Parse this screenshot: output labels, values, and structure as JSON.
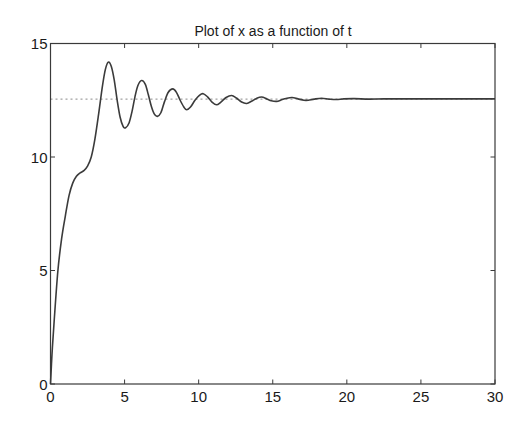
{
  "chart_data": {
    "type": "line",
    "title": "Plot of x as a function of t",
    "xlabel": "",
    "ylabel": "",
    "xlim": [
      0,
      30
    ],
    "ylim": [
      0,
      15
    ],
    "xticks": [
      0,
      5,
      10,
      15,
      20,
      25,
      30
    ],
    "yticks": [
      0,
      5,
      10,
      15
    ],
    "xtick_labels": [
      "0",
      "5",
      "10",
      "15",
      "20",
      "25",
      "30"
    ],
    "ytick_labels": [
      "0",
      "5",
      "10",
      "15"
    ],
    "grid": false,
    "legend": null,
    "reference_line": {
      "orientation": "horizontal",
      "y": 12.55,
      "style": "dotted",
      "x_range": [
        0,
        30
      ]
    },
    "series": [
      {
        "name": "x(t)",
        "style": "solid",
        "x": [
          0,
          0.1,
          0.25,
          0.5,
          0.75,
          1.0,
          1.25,
          1.5,
          1.75,
          2.0,
          2.25,
          2.5,
          2.75,
          3.0,
          3.25,
          3.5,
          3.7,
          3.9,
          4.1,
          4.3,
          4.5,
          4.7,
          4.9,
          5.07,
          5.3,
          5.5,
          5.7,
          5.9,
          6.15,
          6.4,
          6.6,
          6.8,
          7.0,
          7.21,
          7.45,
          7.7,
          7.95,
          8.25,
          8.5,
          8.75,
          9.0,
          9.19,
          9.45,
          9.75,
          10.05,
          10.31,
          10.6,
          10.9,
          11.21,
          11.5,
          11.85,
          12.22,
          12.55,
          12.9,
          13.24,
          13.6,
          13.9,
          14.25,
          14.6,
          14.9,
          15.26,
          15.6,
          15.9,
          16.3,
          16.7,
          17.1,
          17.4,
          17.8,
          18.3,
          18.8,
          19.3,
          19.8,
          20.5,
          21.5,
          22.5,
          24,
          26,
          28,
          30
        ],
        "y": [
          0,
          1.3,
          2.8,
          5.0,
          6.4,
          7.4,
          8.3,
          8.85,
          9.15,
          9.3,
          9.4,
          9.6,
          10.0,
          10.8,
          11.9,
          13.1,
          13.85,
          14.18,
          14.0,
          13.4,
          12.5,
          11.75,
          11.35,
          11.29,
          11.5,
          12.0,
          12.65,
          13.15,
          13.37,
          13.2,
          12.75,
          12.25,
          11.9,
          11.79,
          11.95,
          12.45,
          12.85,
          13.0,
          12.85,
          12.5,
          12.2,
          12.08,
          12.2,
          12.5,
          12.72,
          12.79,
          12.65,
          12.42,
          12.3,
          12.42,
          12.62,
          12.71,
          12.6,
          12.42,
          12.36,
          12.47,
          12.58,
          12.64,
          12.56,
          12.48,
          12.45,
          12.52,
          12.58,
          12.62,
          12.56,
          12.5,
          12.5,
          12.55,
          12.59,
          12.55,
          12.53,
          12.56,
          12.57,
          12.55,
          12.56,
          12.56,
          12.56,
          12.56,
          12.56
        ]
      }
    ]
  },
  "plot_area": {
    "left": 50.5,
    "top": 43.5,
    "right": 495,
    "bottom": 384
  },
  "colors": {
    "curve": "#3b3b3b",
    "axes": "#3a3a3a",
    "reference": "#8a8a8a",
    "background": "#ffffff"
  }
}
